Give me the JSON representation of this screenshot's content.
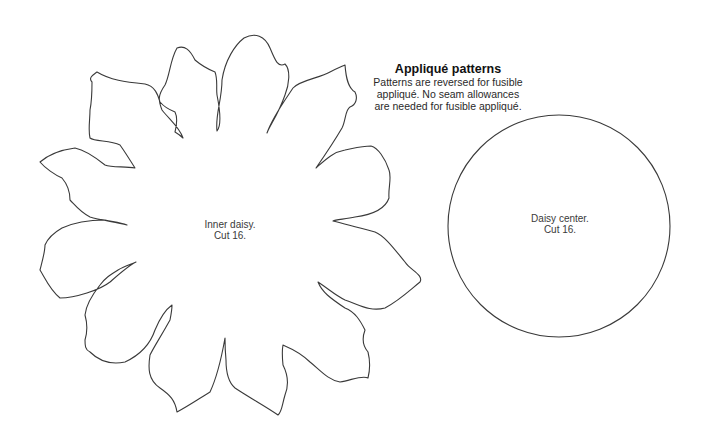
{
  "header": {
    "title": "Appliqué patterns",
    "lines": [
      "Patterns are reversed for fusible",
      "appliqué. No seam allowances",
      "are needed for fusible appliqué."
    ]
  },
  "patterns": [
    {
      "name": "inner-daisy",
      "label_line1": "Inner daisy.",
      "label_line2": "Cut 16.",
      "shape": "16-petal flower outline"
    },
    {
      "name": "daisy-center",
      "label_line1": "Daisy center.",
      "label_line2": "Cut 16.",
      "shape": "circle"
    }
  ],
  "style": {
    "stroke": "#333333",
    "background": "#ffffff"
  }
}
